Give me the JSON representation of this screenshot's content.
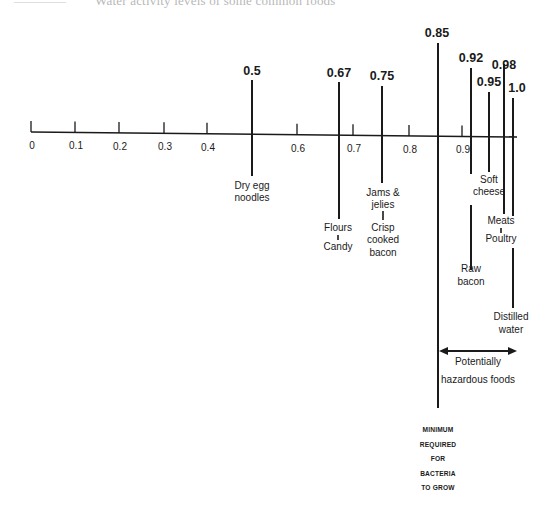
{
  "caption": {
    "left_fragment": "————",
    "text": "Water activity levels of some common foods"
  },
  "chart_data": {
    "type": "number-line",
    "title": "Water activity levels of some common foods",
    "xlabel": "",
    "ylabel": "",
    "axis_range": [
      0,
      1.0
    ],
    "tick_labels": [
      "0",
      "0.1",
      "0.2",
      "0.3",
      "0.4",
      "0.6",
      "0.7",
      "0.8",
      "0.9"
    ],
    "markers": [
      {
        "value": 0.5,
        "label": "0.5",
        "foods": [
          "Dry egg noodles"
        ]
      },
      {
        "value": 0.67,
        "label": "0.67",
        "foods": [
          "Flours",
          "Candy"
        ]
      },
      {
        "value": 0.75,
        "label": "0.75",
        "foods": [
          "Jams & jelies",
          "Crisp cooked bacon"
        ]
      },
      {
        "value": 0.85,
        "label": "0.85",
        "foods": [],
        "note": "MINIMUM REQUIRED FOR BACTERIA TO GROW"
      },
      {
        "value": 0.92,
        "label": "0.92",
        "foods": [
          "Raw bacon"
        ]
      },
      {
        "value": 0.95,
        "label": "0.95",
        "foods": [
          "Soft cheese"
        ]
      },
      {
        "value": 0.98,
        "label": "0.98",
        "foods": [
          "Meats",
          "Poultry"
        ]
      },
      {
        "value": 1.0,
        "label": "1.0",
        "foods": [
          "Distilled water"
        ]
      }
    ],
    "range_annotation": {
      "from": 0.85,
      "to": 1.0,
      "label": "Potentially hazardous foods"
    },
    "grid": false,
    "legend": null
  },
  "axis": {
    "ticks": [
      {
        "label": "0",
        "x": 31
      },
      {
        "label": "0.1",
        "x": 75
      },
      {
        "label": "0.2",
        "x": 119
      },
      {
        "label": "0.3",
        "x": 164
      },
      {
        "label": "0.4",
        "x": 207
      },
      {
        "label": "",
        "x": 252
      },
      {
        "label": "0.6",
        "x": 297
      },
      {
        "label": "0.7",
        "x": 353
      },
      {
        "label": "0.8",
        "x": 409
      },
      {
        "label": "0.9",
        "x": 462
      }
    ]
  },
  "markers": [
    {
      "value_label": "0.5",
      "x": 252,
      "top": 80,
      "segments": [
        [
          80,
          176
        ]
      ],
      "label_x": 252,
      "label_y": 75,
      "food_lines": [
        {
          "text": "Dry egg",
          "y": 189
        },
        {
          "text": "noodles",
          "y": 201
        }
      ],
      "food_x": 252
    },
    {
      "value_label": "0.67",
      "x": 339,
      "top": 82,
      "segments": [
        [
          82,
          219
        ]
      ],
      "label_x": 339,
      "label_y": 77,
      "food_lines": [
        {
          "text": "Flours",
          "y": 231
        },
        {
          "text": "Candy",
          "y": 250
        }
      ],
      "food_x": 338,
      "connector": [
        235,
        240
      ]
    },
    {
      "value_label": "0.75",
      "x": 382,
      "top": 86,
      "segments": [
        [
          86,
          183
        ]
      ],
      "label_x": 382,
      "label_y": 80,
      "food_lines": [
        {
          "text": "Jams &",
          "y": 196
        },
        {
          "text": "jelies",
          "y": 208
        },
        {
          "text": "Crisp",
          "y": 231
        },
        {
          "text": "cooked",
          "y": 243
        },
        {
          "text": "bacon",
          "y": 256
        }
      ],
      "food_x": 383,
      "connector": [
        211,
        220
      ]
    },
    {
      "value_label": "0.85",
      "x": 438,
      "top": 43,
      "segments": [
        [
          43,
          408
        ]
      ],
      "label_x": 437,
      "label_y": 37,
      "food_lines": [],
      "food_x": 438
    },
    {
      "value_label": "0.92",
      "x": 471,
      "top": 68,
      "segments": [
        [
          68,
          174
        ],
        [
          205,
          270
        ]
      ],
      "label_x": 471,
      "label_y": 62,
      "food_lines": [
        {
          "text": "Raw",
          "y": 272
        },
        {
          "text": "bacon",
          "y": 285
        }
      ],
      "food_x": 471
    },
    {
      "value_label": "0.95",
      "x": 489,
      "top": 92,
      "segments": [
        [
          92,
          172
        ]
      ],
      "label_x": 489,
      "label_y": 86,
      "food_lines": [
        {
          "text": "Soft",
          "y": 183
        },
        {
          "text": "cheese",
          "y": 195
        }
      ],
      "food_x": 489
    },
    {
      "value_label": "0.98",
      "x": 504,
      "top": 64,
      "segments": [
        [
          64,
          214
        ]
      ],
      "label_x": 504,
      "label_y": 69,
      "food_lines": [
        {
          "text": "Meats",
          "y": 224
        },
        {
          "text": "Poultry",
          "y": 242
        }
      ],
      "food_x": 501,
      "connector": [
        228,
        233
      ]
    },
    {
      "value_label": "1.0",
      "x": 513,
      "top": 98,
      "segments": [
        [
          98,
          216
        ],
        [
          248,
          308
        ]
      ],
      "label_x": 517,
      "label_y": 92,
      "food_lines": [
        {
          "text": "Distilled",
          "y": 320
        },
        {
          "text": "water",
          "y": 333
        }
      ],
      "food_x": 511
    }
  ],
  "range_annotation": {
    "x1": 439,
    "x2": 517,
    "y": 351,
    "lines": [
      {
        "text": "Potentially",
        "y": 365
      },
      {
        "text": "hazardous foods",
        "y": 383
      }
    ],
    "text_x": 478
  },
  "minimum_note": {
    "x": 438,
    "lines": [
      {
        "text": "MINIMUM",
        "y": 432
      },
      {
        "text": "REQUIRED",
        "y": 447
      },
      {
        "text": "FOR",
        "y": 461
      },
      {
        "text": "BACTERIA",
        "y": 476
      },
      {
        "text": "TO GROW",
        "y": 490
      }
    ]
  }
}
